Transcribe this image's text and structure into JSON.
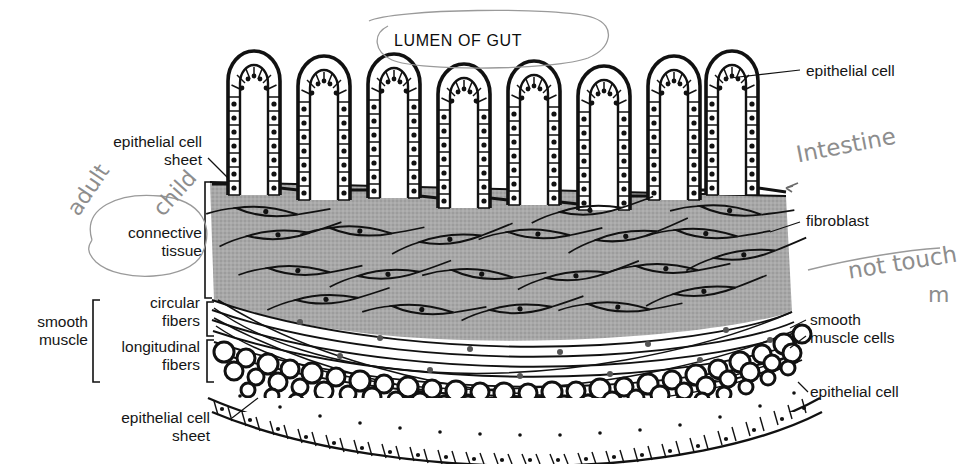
{
  "figure": {
    "title": "LUMEN OF GUT",
    "background_color": "#ffffff",
    "connective_tissue_fill": "#a8a8a8",
    "ink_color": "#111111",
    "pencil_color": "#8d8d8d"
  },
  "labels": {
    "lumen_of_gut": "LUMEN OF GUT",
    "epithelial_cell_top": "epithelial cell",
    "epithelial_cell_sheet_top": "epithelial cell\nsheet",
    "connective_tissue": "connective\ntissue",
    "fibroblast": "fibroblast",
    "smooth_muscle": "smooth\nmuscle",
    "circular_fibers": "circular\nfibers",
    "longitudinal_fibers": "longitudinal\nfibers",
    "smooth_muscle_cells": "smooth\nmuscle cells",
    "epithelial_cell_bottom": "epithelial cell",
    "epithelial_cell_sheet_bottom": "epithelial cell\nsheet"
  },
  "annotations": [
    {
      "name": "intestine",
      "text": "Intestine",
      "style": "handwritten-pencil"
    },
    {
      "name": "adult",
      "text": "adult",
      "style": "handwritten-pencil"
    },
    {
      "name": "child",
      "text": "child",
      "style": "handwritten-pencil"
    },
    {
      "name": "not-touch",
      "text": "not touch",
      "style": "handwritten-pencil"
    },
    {
      "name": "m-partial",
      "text": "m",
      "style": "handwritten-pencil"
    }
  ],
  "layers": [
    {
      "name": "villi-epithelium",
      "count": 8,
      "description": "finger-like villi lined with columnar epithelial cells with nuclei"
    },
    {
      "name": "connective-tissue",
      "description": "gray stippled matrix containing spindle-shaped fibroblasts"
    },
    {
      "name": "circular-fibers",
      "description": "long sweeping smooth muscle fibers cut lengthwise"
    },
    {
      "name": "longitudinal-fibers",
      "description": "smooth muscle cells cut in cross-section, drawn as circles"
    },
    {
      "name": "outer-epithelial-sheet",
      "description": "single row of cuboidal epithelial cells with nuclei"
    }
  ]
}
